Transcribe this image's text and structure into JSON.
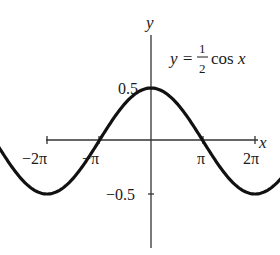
{
  "chart_data": {
    "type": "line",
    "equation": {
      "lhs": "y =",
      "frac_num": "1",
      "frac_den": "2",
      "rhs": "cos x"
    },
    "xlabel": "x",
    "ylabel": "y",
    "xlim": [
      -6.2832,
      6.2832
    ],
    "ylim": [
      -0.5,
      0.5
    ],
    "x_ticks": [
      {
        "value": -6.2832,
        "label": "−2π"
      },
      {
        "value": -3.1416,
        "label": "−π"
      },
      {
        "value": 3.1416,
        "label": "π"
      },
      {
        "value": 6.2832,
        "label": "2π"
      }
    ],
    "y_ticks": [
      {
        "value": 0.5,
        "label": "0.5"
      },
      {
        "value": -0.5,
        "label": "−0.5"
      }
    ],
    "series": [
      {
        "name": "y = 1/2 cos x",
        "function": "0.5*cos(x)",
        "x": [
          -6.2832,
          -4.7124,
          -3.1416,
          -1.5708,
          0,
          1.5708,
          3.1416,
          4.7124,
          6.2832
        ],
        "values": [
          0.5,
          0,
          -0.5,
          0,
          0.5,
          0,
          -0.5,
          0,
          0.5
        ]
      }
    ],
    "grid": false,
    "legend": false
  },
  "style": {
    "curve_color": "#111111",
    "axis_color": "#333333"
  }
}
